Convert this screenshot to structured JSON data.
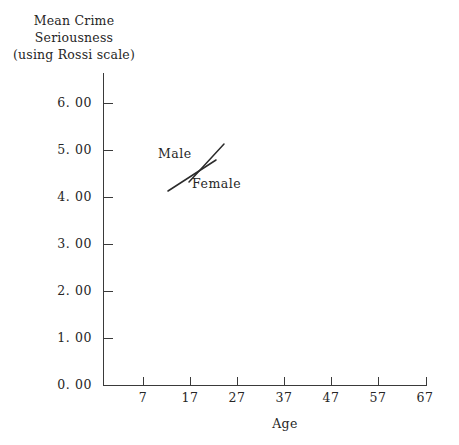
{
  "chart_data": {
    "type": "line",
    "title": "",
    "ylabel": "Mean Crime Seriousness (using Rossi scale)",
    "ylabel_lines": [
      "Mean Crime",
      "Seriousness",
      "(using Rossi scale)"
    ],
    "xlabel": "Age",
    "xlim": [
      2,
      72
    ],
    "ylim": [
      0.0,
      6.0
    ],
    "grid": false,
    "legend_position": "inside-upper-left",
    "x_tick_labels": [
      "7",
      "17",
      "27",
      "37",
      "47",
      "57",
      "67"
    ],
    "x_tick_values": [
      7,
      17,
      27,
      37,
      47,
      57,
      67
    ],
    "y_tick_labels": [
      "0. 00",
      "1. 00",
      "2. 00",
      "3. 00",
      "4. 00",
      "5. 00",
      "6. 00"
    ],
    "y_tick_values": [
      0.0,
      1.0,
      2.0,
      3.0,
      4.0,
      5.0,
      6.0
    ],
    "series": [
      {
        "name": "Male",
        "values": [],
        "key_line": {
          "x1": 39,
          "y1": 44,
          "x2": 74,
          "y2": 6
        }
      },
      {
        "name": "Female",
        "values": [],
        "key_line": {
          "x1": 18,
          "y1": 53,
          "x2": 66,
          "y2": 22
        }
      }
    ],
    "annotations": []
  },
  "figure": {
    "ink_color": "#2b2b2b",
    "axis_color": "#3a3a3a",
    "background_color": "#ffffff"
  }
}
